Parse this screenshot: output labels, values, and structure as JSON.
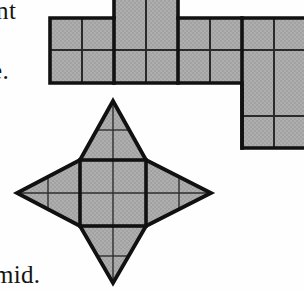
{
  "page": {
    "width": 304,
    "height": 290,
    "background_color": "#fefefe"
  },
  "colors": {
    "fill_gray": "#a9a9a9",
    "outline_black": "#111111",
    "inner_line": "#1a1a1a",
    "text_black": "#141414",
    "paper_white": "#fefefe"
  },
  "text_fragments": {
    "top_left": "nt",
    "middle_left": "e.",
    "bottom_left": "mid."
  },
  "figures": [
    {
      "name": "polyomino-net",
      "type": "square-grid-net",
      "cell_size": 32,
      "origin_x": 50,
      "origin_y": 18,
      "cells": [
        {
          "col": 2,
          "row": -1
        },
        {
          "col": 3,
          "row": -1
        },
        {
          "col": 0,
          "row": 0
        },
        {
          "col": 1,
          "row": 0
        },
        {
          "col": 2,
          "row": 0
        },
        {
          "col": 3,
          "row": 0
        },
        {
          "col": 4,
          "row": 0
        },
        {
          "col": 5,
          "row": 0
        },
        {
          "col": 6,
          "row": 0
        },
        {
          "col": 7,
          "row": 0
        },
        {
          "col": 0,
          "row": 1
        },
        {
          "col": 1,
          "row": 1
        },
        {
          "col": 2,
          "row": 1
        },
        {
          "col": 3,
          "row": 1
        },
        {
          "col": 4,
          "row": 1
        },
        {
          "col": 5,
          "row": 1
        },
        {
          "col": 6,
          "row": 1
        },
        {
          "col": 7,
          "row": 1
        },
        {
          "col": 6,
          "row": 2
        },
        {
          "col": 7,
          "row": 2
        },
        {
          "col": 6,
          "row": 3
        },
        {
          "col": 7,
          "row": 3
        }
      ],
      "cell_count": 22
    },
    {
      "name": "four-pointed-star-net",
      "type": "star-net",
      "center_x": 113,
      "center_y": 193,
      "square_half": 33,
      "point_top": {
        "x": 113,
        "y": 101
      },
      "point_bottom": {
        "x": 113,
        "y": 283
      },
      "point_left": {
        "x": 17,
        "y": 193
      },
      "point_right": {
        "x": 211,
        "y": 193
      },
      "square": {
        "left": 80,
        "top": 160,
        "right": 146,
        "bottom": 226
      },
      "inner_grid": "2x2",
      "flap_subdivisions": 2
    }
  ]
}
